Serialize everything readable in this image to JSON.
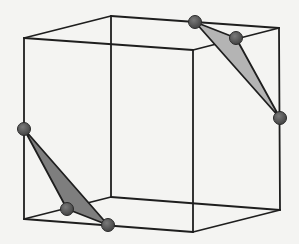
{
  "figure": {
    "title": "",
    "colors": {
      "background": "#f4f4f2",
      "edges": "#1e1e1e",
      "triangle_top": "#b4b4b4",
      "triangle_bottom": "#7e7e7e",
      "spheres": "#555555"
    },
    "cube_vertices": {
      "front_top_left": [
        24,
        38
      ],
      "front_top_right": [
        193,
        50
      ],
      "back_top_left": [
        111,
        16
      ],
      "back_top_right": [
        279,
        28
      ],
      "front_bottom_left": [
        24,
        219
      ],
      "front_bottom_right": [
        193,
        232
      ],
      "back_bottom_left": [
        111,
        197
      ],
      "back_bottom_right": [
        280,
        210
      ]
    },
    "triangles": [
      {
        "name": "top-right-corner-section",
        "points": [
          [
            195,
            22
          ],
          [
            236,
            38
          ],
          [
            280,
            118
          ]
        ],
        "fill": "#b4b4b4"
      },
      {
        "name": "bottom-left-corner-section",
        "points": [
          [
            24,
            129
          ],
          [
            67,
            209
          ],
          [
            108,
            225
          ]
        ],
        "fill": "#7e7e7e"
      }
    ],
    "spheres": [
      {
        "name": "sphere-top-1",
        "center": [
          195,
          22
        ],
        "r": 6.5
      },
      {
        "name": "sphere-top-2",
        "center": [
          236,
          38
        ],
        "r": 6.5
      },
      {
        "name": "sphere-top-3",
        "center": [
          280,
          118
        ],
        "r": 6.5
      },
      {
        "name": "sphere-bottom-1",
        "center": [
          24,
          129
        ],
        "r": 6.5
      },
      {
        "name": "sphere-bottom-2",
        "center": [
          67,
          209
        ],
        "r": 6.5
      },
      {
        "name": "sphere-bottom-3",
        "center": [
          108,
          225
        ],
        "r": 6.5
      }
    ]
  }
}
